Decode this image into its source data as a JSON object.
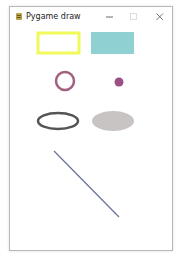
{
  "window": {
    "title": "Pygame draw",
    "app_icon": "pygame-snake-icon",
    "controls": {
      "minimize_icon": "minimize-icon",
      "maximize_icon": "maximize-icon",
      "close_icon": "close-icon"
    }
  },
  "canvas": {
    "background": "#ffffff",
    "shapes": [
      {
        "name": "rectangle-outline",
        "kind": "rect",
        "fill": "none",
        "stroke": "#f0f85a"
      },
      {
        "name": "rectangle-filled",
        "kind": "rect",
        "fill": "#8fd0d3",
        "stroke": "none"
      },
      {
        "name": "circle-outline",
        "kind": "circle",
        "fill": "none",
        "stroke": "#a0607e"
      },
      {
        "name": "circle-filled",
        "kind": "circle",
        "fill": "#9b4f86",
        "stroke": "none"
      },
      {
        "name": "ellipse-outline",
        "kind": "ellipse",
        "fill": "none",
        "stroke": "#555555"
      },
      {
        "name": "ellipse-filled",
        "kind": "ellipse",
        "fill": "#c9c4c4",
        "stroke": "none"
      },
      {
        "name": "line",
        "kind": "line",
        "stroke": "#6a6f9c"
      }
    ]
  }
}
